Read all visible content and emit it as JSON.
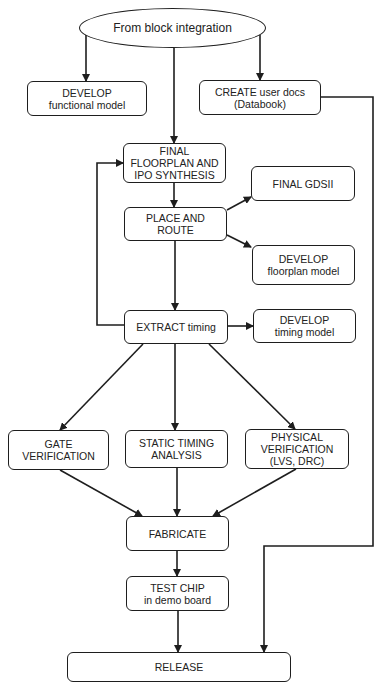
{
  "diagram": {
    "colors": {
      "line": "#1e1e1e",
      "text": "#222222",
      "background": "#ffffff"
    },
    "nodes": [
      {
        "id": "start",
        "shape": "ellipse",
        "lines": [
          "From block integration"
        ],
        "x": 79,
        "y": 8,
        "w": 187,
        "h": 40
      },
      {
        "id": "develop-functional",
        "shape": "box",
        "lines": [
          "DEVELOP",
          "functional model"
        ],
        "x": 27,
        "y": 81,
        "w": 120,
        "h": 35
      },
      {
        "id": "create-docs",
        "shape": "box",
        "lines": [
          "CREATE user docs",
          "(Databook)"
        ],
        "x": 199,
        "y": 80,
        "w": 122,
        "h": 35
      },
      {
        "id": "final-floorplan",
        "shape": "box",
        "lines": [
          "FINAL",
          "FLOORPLAN AND",
          "IPO SYNTHESIS"
        ],
        "x": 123,
        "y": 143,
        "w": 103,
        "h": 40
      },
      {
        "id": "final-gdsii",
        "shape": "box",
        "lines": [
          "FINAL GDSII"
        ],
        "x": 251,
        "y": 166,
        "w": 104,
        "h": 35
      },
      {
        "id": "place-route",
        "shape": "box",
        "lines": [
          "PLACE AND",
          "ROUTE"
        ],
        "x": 124,
        "y": 207,
        "w": 103,
        "h": 34
      },
      {
        "id": "develop-floorplan",
        "shape": "box",
        "lines": [
          "DEVELOP",
          "floorplan model"
        ],
        "x": 252,
        "y": 245,
        "w": 103,
        "h": 40
      },
      {
        "id": "extract-timing",
        "shape": "box",
        "lines": [
          "EXTRACT timing"
        ],
        "x": 124,
        "y": 310,
        "w": 104,
        "h": 34
      },
      {
        "id": "develop-timing",
        "shape": "box",
        "lines": [
          "DEVELOP",
          "timing model"
        ],
        "x": 253,
        "y": 309,
        "w": 103,
        "h": 34
      },
      {
        "id": "gate-verification",
        "shape": "box",
        "lines": [
          "GATE",
          "VERIFICATION"
        ],
        "x": 8,
        "y": 430,
        "w": 101,
        "h": 40
      },
      {
        "id": "static-timing",
        "shape": "box",
        "lines": [
          "STATIC TIMING",
          "ANALYSIS"
        ],
        "x": 125,
        "y": 430,
        "w": 103,
        "h": 38
      },
      {
        "id": "physical-verification",
        "shape": "box",
        "lines": [
          "PHYSICAL",
          "VERIFICATION",
          "(LVS, DRC)"
        ],
        "x": 245,
        "y": 429,
        "w": 104,
        "h": 40
      },
      {
        "id": "fabricate",
        "shape": "box",
        "lines": [
          "FABRICATE"
        ],
        "x": 126,
        "y": 516,
        "w": 103,
        "h": 35
      },
      {
        "id": "test-chip",
        "shape": "box",
        "lines": [
          "TEST CHIP",
          "in demo board"
        ],
        "x": 126,
        "y": 576,
        "w": 103,
        "h": 35
      },
      {
        "id": "release",
        "shape": "box",
        "lines": [
          "RELEASE"
        ],
        "x": 67,
        "y": 652,
        "w": 224,
        "h": 30
      }
    ],
    "edges": [
      {
        "id": "start-to-develop-functional",
        "points": [
          [
            86,
            35
          ],
          [
            86,
            81
          ]
        ],
        "arrow": true
      },
      {
        "id": "start-to-create-docs",
        "points": [
          [
            260,
            35
          ],
          [
            260,
            80
          ]
        ],
        "arrow": true
      },
      {
        "id": "start-to-final-floorplan",
        "points": [
          [
            174,
            48
          ],
          [
            174,
            143
          ]
        ],
        "arrow": true
      },
      {
        "id": "create-docs-to-release",
        "points": [
          [
            321,
            97
          ],
          [
            373,
            97
          ],
          [
            373,
            546
          ],
          [
            264,
            546
          ],
          [
            264,
            652
          ]
        ],
        "arrow": true
      },
      {
        "id": "final-floorplan-to-place-route",
        "points": [
          [
            174,
            183
          ],
          [
            174,
            207
          ]
        ],
        "arrow": true
      },
      {
        "id": "place-route-to-final-gdsii",
        "points": [
          [
            227,
            210
          ],
          [
            251,
            197
          ]
        ],
        "arrow": true
      },
      {
        "id": "place-route-to-develop-floorplan",
        "points": [
          [
            227,
            235
          ],
          [
            251,
            247
          ]
        ],
        "arrow": true
      },
      {
        "id": "place-route-to-extract-timing",
        "points": [
          [
            175,
            241
          ],
          [
            175,
            310
          ]
        ],
        "arrow": true
      },
      {
        "id": "extract-timing-feedback",
        "points": [
          [
            124,
            325
          ],
          [
            97,
            325
          ],
          [
            97,
            163
          ],
          [
            123,
            163
          ]
        ],
        "arrow": true
      },
      {
        "id": "extract-timing-to-develop-timing",
        "points": [
          [
            228,
            326
          ],
          [
            253,
            326
          ]
        ],
        "arrow": true
      },
      {
        "id": "extract-timing-to-gate",
        "points": [
          [
            143,
            344
          ],
          [
            60,
            430
          ]
        ],
        "arrow": true
      },
      {
        "id": "extract-timing-to-static",
        "points": [
          [
            175,
            344
          ],
          [
            175,
            430
          ]
        ],
        "arrow": true
      },
      {
        "id": "extract-timing-to-physical",
        "points": [
          [
            209,
            344
          ],
          [
            295,
            429
          ]
        ],
        "arrow": true
      },
      {
        "id": "gate-to-fabricate",
        "points": [
          [
            60,
            470
          ],
          [
            142,
            516
          ]
        ],
        "arrow": true
      },
      {
        "id": "static-to-fabricate",
        "points": [
          [
            177,
            468
          ],
          [
            177,
            516
          ]
        ],
        "arrow": true
      },
      {
        "id": "physical-to-fabricate",
        "points": [
          [
            296,
            469
          ],
          [
            213,
            516
          ]
        ],
        "arrow": true
      },
      {
        "id": "fabricate-to-test-chip",
        "points": [
          [
            177,
            551
          ],
          [
            177,
            576
          ]
        ],
        "arrow": true
      },
      {
        "id": "test-chip-to-release",
        "points": [
          [
            178,
            611
          ],
          [
            178,
            652
          ]
        ],
        "arrow": true
      }
    ]
  }
}
